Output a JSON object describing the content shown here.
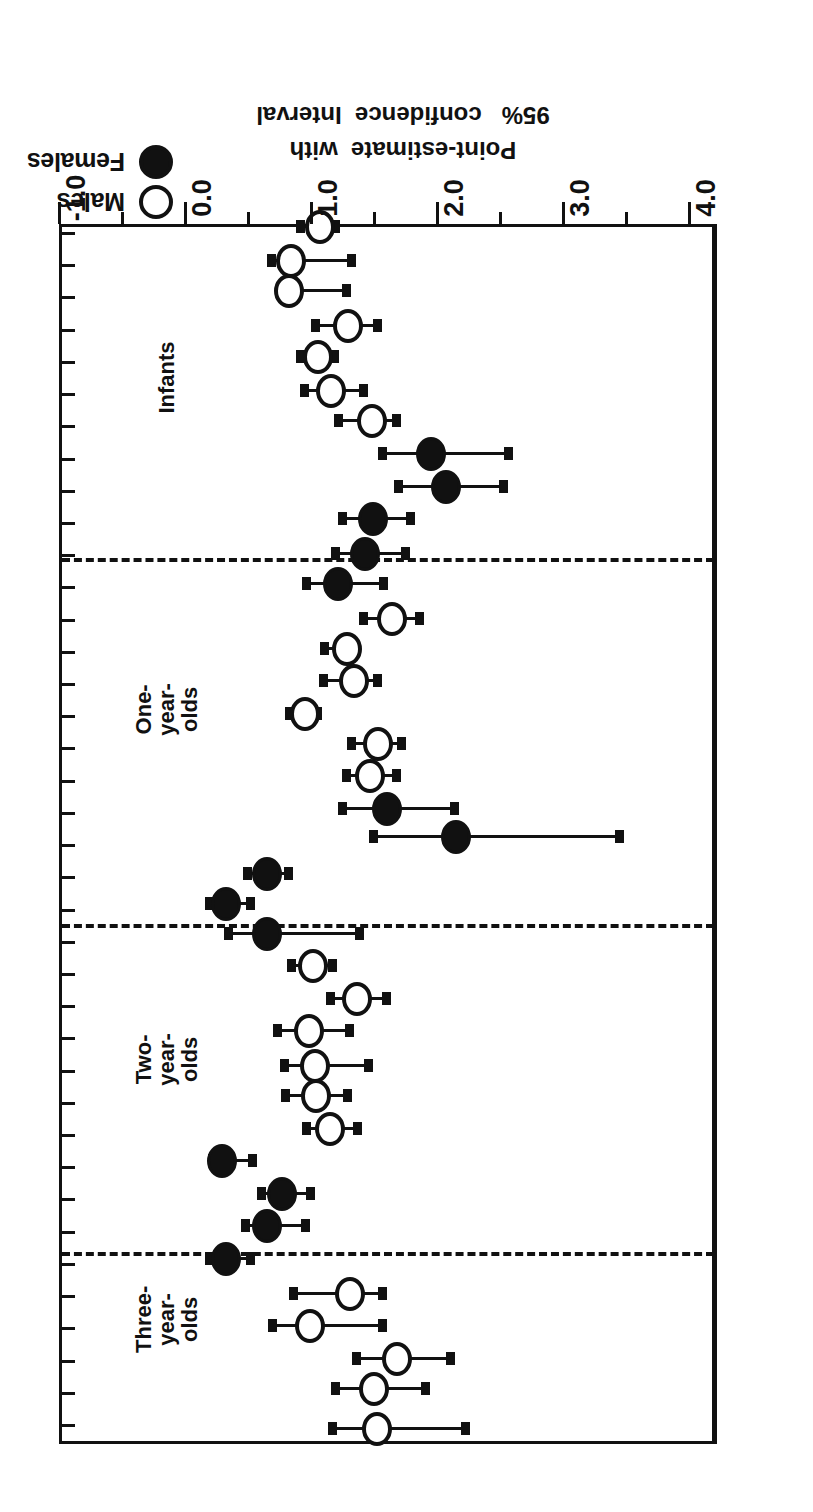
{
  "legend": {
    "items": [
      {
        "label": "Males",
        "marker": "open-circle-icon"
      },
      {
        "label": "Females",
        "marker": "filled-circle-icon"
      }
    ]
  },
  "axis": {
    "title_line1": "Point-estimate  with",
    "title_line2": "95%   confidence  Interval",
    "ticks": [
      "4.0",
      "3.0",
      "2.0",
      "1.0",
      "0.0",
      "-1.0"
    ]
  },
  "chart_data": {
    "type": "scatter",
    "title": "",
    "xlabel": "Point-estimate with 95% confidence Interval",
    "ylabel": "",
    "xlim": [
      -1.0,
      4.0
    ],
    "grid": false,
    "reference_line": 1.0,
    "legend_position": "top-left",
    "orientation": "forest-plot-horizontal-intervals",
    "group_labels": [
      "Infants",
      "One-year-olds",
      "Two-year-olds",
      "Three-\nyear-\nolds"
    ],
    "series": [
      {
        "name": "Males",
        "marker": "open-circle"
      },
      {
        "name": "Females",
        "marker": "filled-circle"
      }
    ],
    "groups": [
      {
        "name": "Infants",
        "points": [
          {
            "sex": "Males",
            "estimate": 0.61,
            "low": 0.21,
            "high": 0.95
          },
          {
            "sex": "Males",
            "estimate": 0.72,
            "low": 0.5,
            "high": 0.88
          },
          {
            "sex": "Males",
            "estimate": 0.79,
            "low": 0.56,
            "high": 1.01
          },
          {
            "sex": "Males",
            "estimate": 1.25,
            "low": 1.06,
            "high": 1.44
          },
          {
            "sex": "Males",
            "estimate": 0.99,
            "low": 0.78,
            "high": 1.13
          },
          {
            "sex": "Males",
            "estimate": 1.09,
            "low": 0.85,
            "high": 1.32
          },
          {
            "sex": "Males",
            "estimate": 1.44,
            "low": 1.17,
            "high": 1.64
          },
          {
            "sex": "Females",
            "estimate": 1.93,
            "low": 1.23,
            "high": 2.78
          },
          {
            "sex": "Females",
            "estimate": 1.62,
            "low": 1.1,
            "high": 2.6
          },
          {
            "sex": "Females",
            "estimate": 1.16,
            "low": 0.85,
            "high": 1.54
          },
          {
            "sex": "Females",
            "estimate": 1.0,
            "low": 0.77,
            "high": 1.54
          },
          {
            "sex": "Females",
            "estimate": 0.78,
            "low": 0.52,
            "high": 1.18
          }
        ]
      },
      {
        "name": "One-year-olds",
        "points": [
          {
            "sex": "Males",
            "estimate": 1.48,
            "low": 1.26,
            "high": 1.67
          },
          {
            "sex": "Males",
            "estimate": 1.11,
            "low": 0.91,
            "high": 1.3
          },
          {
            "sex": "Males",
            "estimate": 1.19,
            "low": 0.98,
            "high": 1.42
          },
          {
            "sex": "Males",
            "estimate": 0.63,
            "low": 0.44,
            "high": 0.79
          },
          {
            "sex": "Males",
            "estimate": 1.53,
            "low": 1.31,
            "high": 1.72
          },
          {
            "sex": "Males",
            "estimate": 1.47,
            "low": 1.22,
            "high": 1.69
          },
          {
            "sex": "Females",
            "estimate": 1.53,
            "low": 1.02,
            "high": 2.12
          },
          {
            "sex": "Females",
            "estimate": 2.23,
            "low": 1.26,
            "high": 3.44
          },
          {
            "sex": "Females",
            "estimate": 0.7,
            "low": 0.48,
            "high": 0.86
          },
          {
            "sex": "Females",
            "estimate": 0.34,
            "low": 0.16,
            "high": 0.46
          },
          {
            "sex": "Females",
            "estimate": 0.7,
            "low": 0.21,
            "high": 1.45
          }
        ]
      },
      {
        "name": "Two-year-olds",
        "points": [
          {
            "sex": "Males",
            "estimate": 1.0,
            "low": 0.76,
            "high": 1.17
          },
          {
            "sex": "Males",
            "estimate": 1.36,
            "low": 1.0,
            "high": 1.65
          },
          {
            "sex": "Males",
            "estimate": 1.09,
            "low": 0.74,
            "high": 1.41
          },
          {
            "sex": "Males",
            "estimate": 1.05,
            "low": 0.65,
            "high": 1.36
          },
          {
            "sex": "Males",
            "estimate": 1.11,
            "low": 0.79,
            "high": 1.5
          },
          {
            "sex": "Males",
            "estimate": 1.17,
            "low": 0.87,
            "high": 1.46
          },
          {
            "sex": "Females",
            "estimate": 0.18,
            "low": 0.02,
            "high": 0.34
          },
          {
            "sex": "Females",
            "estimate": 0.65,
            "low": 0.45,
            "high": 0.92
          },
          {
            "sex": "Females",
            "estimate": 0.77,
            "low": 0.55,
            "high": 0.94
          },
          {
            "sex": "Females",
            "estimate": 0.15,
            "low": 0.02,
            "high": 0.33
          }
        ]
      },
      {
        "name": "Three-year-olds",
        "points": [
          {
            "sex": "Males",
            "estimate": 1.08,
            "low": 0.78,
            "high": 1.29
          },
          {
            "sex": "Males",
            "estimate": 0.77,
            "low": 0.48,
            "high": 1.29
          },
          {
            "sex": "Males",
            "estimate": 1.64,
            "low": 1.13,
            "high": 1.93
          },
          {
            "sex": "Males",
            "estimate": 1.49,
            "low": 1.01,
            "high": 1.91
          },
          {
            "sex": "Males",
            "estimate": 1.52,
            "low": 0.87,
            "high": 2.11
          }
        ]
      }
    ]
  },
  "layout": {
    "rows": [
      {
        "y": 1282,
        "sex": "Males",
        "est": 1.08,
        "lo": 0.93,
        "hi": 1.21
      },
      {
        "y": 1248,
        "sex": "Males",
        "est": 0.85,
        "lo": 0.7,
        "hi": 1.33
      },
      {
        "y": 1218,
        "sex": "Males",
        "est": 0.83,
        "lo": 0.82,
        "hi": 1.29
      },
      {
        "y": 1183,
        "sex": "Males",
        "est": 1.3,
        "lo": 1.05,
        "hi": 1.54
      },
      {
        "y": 1152,
        "sex": "Males",
        "est": 1.06,
        "lo": 0.93,
        "hi": 1.2
      },
      {
        "y": 1118,
        "sex": "Males",
        "est": 1.17,
        "lo": 0.96,
        "hi": 1.43
      },
      {
        "y": 1088,
        "sex": "Males",
        "est": 1.49,
        "lo": 1.23,
        "hi": 1.69
      },
      {
        "y": 1055,
        "sex": "Females",
        "est": 1.96,
        "lo": 1.58,
        "hi": 2.58
      },
      {
        "y": 1022,
        "sex": "Females",
        "est": 2.08,
        "lo": 1.71,
        "hi": 2.54
      },
      {
        "y": 990,
        "sex": "Females",
        "est": 1.5,
        "lo": 1.26,
        "hi": 1.8
      },
      {
        "y": 955,
        "sex": "Females",
        "est": 1.44,
        "lo": 1.21,
        "hi": 1.76
      },
      {
        "y": 925,
        "sex": "Females",
        "est": 1.22,
        "lo": 0.98,
        "hi": 1.59
      },
      {
        "y": 890,
        "sex": "Males",
        "est": 1.65,
        "lo": 1.43,
        "hi": 1.87
      },
      {
        "y": 860,
        "sex": "Males",
        "est": 1.29,
        "lo": 1.12,
        "hi": 1.35
      },
      {
        "y": 828,
        "sex": "Males",
        "est": 1.35,
        "lo": 1.11,
        "hi": 1.54
      },
      {
        "y": 795,
        "sex": "Males",
        "est": 0.96,
        "lo": 0.84,
        "hi": 1.06
      },
      {
        "y": 765,
        "sex": "Males",
        "est": 1.54,
        "lo": 1.33,
        "hi": 1.73
      },
      {
        "y": 733,
        "sex": "Males",
        "est": 1.48,
        "lo": 1.29,
        "hi": 1.69
      },
      {
        "y": 700,
        "sex": "Females",
        "est": 1.61,
        "lo": 1.26,
        "hi": 2.15
      },
      {
        "y": 672,
        "sex": "Females",
        "est": 2.16,
        "lo": 1.51,
        "hi": 3.46
      },
      {
        "y": 635,
        "sex": "Females",
        "est": 0.66,
        "lo": 0.51,
        "hi": 0.83
      },
      {
        "y": 605,
        "sex": "Females",
        "est": 0.33,
        "lo": 0.21,
        "hi": 0.53
      },
      {
        "y": 575,
        "sex": "Females",
        "est": 0.66,
        "lo": 0.36,
        "hi": 1.4
      },
      {
        "y": 543,
        "sex": "Males",
        "est": 1.02,
        "lo": 0.86,
        "hi": 1.18
      },
      {
        "y": 510,
        "sex": "Males",
        "est": 1.37,
        "lo": 1.17,
        "hi": 1.61
      },
      {
        "y": 478,
        "sex": "Males",
        "est": 0.99,
        "lo": 0.75,
        "hi": 1.32
      },
      {
        "y": 443,
        "sex": "Males",
        "est": 1.04,
        "lo": 0.8,
        "hi": 1.47
      },
      {
        "y": 413,
        "sex": "Males",
        "est": 1.05,
        "lo": 0.81,
        "hi": 1.3
      },
      {
        "y": 380,
        "sex": "Males",
        "est": 1.16,
        "lo": 0.98,
        "hi": 1.38
      },
      {
        "y": 348,
        "sex": "Females",
        "est": 0.3,
        "lo": 0.23,
        "hi": 0.55
      },
      {
        "y": 315,
        "sex": "Females",
        "est": 0.78,
        "lo": 0.62,
        "hi": 1.01
      },
      {
        "y": 283,
        "sex": "Females",
        "est": 0.66,
        "lo": 0.49,
        "hi": 0.97
      },
      {
        "y": 250,
        "sex": "Females",
        "est": 0.33,
        "lo": 0.21,
        "hi": 0.53
      },
      {
        "y": 215,
        "sex": "Males",
        "est": 1.32,
        "lo": 0.87,
        "hi": 1.58
      },
      {
        "y": 183,
        "sex": "Males",
        "est": 1.0,
        "lo": 0.71,
        "hi": 1.58
      },
      {
        "y": 150,
        "sex": "Males",
        "est": 1.69,
        "lo": 1.37,
        "hi": 2.12
      },
      {
        "y": 120,
        "sex": "Males",
        "est": 1.51,
        "lo": 1.21,
        "hi": 1.92
      },
      {
        "y": 80,
        "sex": "Males",
        "est": 1.53,
        "lo": 1.18,
        "hi": 2.24
      }
    ],
    "separators": [
      253,
      581,
      947
    ],
    "group_labels": [
      {
        "text": "Infants",
        "y": 1120,
        "x": 643
      },
      {
        "text": "One-year-olds",
        "y": 765,
        "x": 643
      },
      {
        "text": "Two-year-olds",
        "y": 415,
        "x": 643
      },
      {
        "text": "Three-\nyear-\nolds",
        "y": 155,
        "x": 643
      }
    ],
    "x_ticks": [
      {
        "value": 4.0,
        "label": "4.0",
        "major": true
      },
      {
        "value": 3.5,
        "label": "",
        "major": false
      },
      {
        "value": 3.0,
        "label": "3.0",
        "major": true
      },
      {
        "value": 2.5,
        "label": "",
        "major": false
      },
      {
        "value": 2.0,
        "label": "2.0",
        "major": true
      },
      {
        "value": 1.5,
        "label": "",
        "major": false
      },
      {
        "value": 1.0,
        "label": "1.0",
        "major": true
      },
      {
        "value": 0.5,
        "label": "",
        "major": false
      },
      {
        "value": 0.0,
        "label": "0.0",
        "major": true
      },
      {
        "value": -0.5,
        "label": "",
        "major": false
      },
      {
        "value": -1.0,
        "label": "-1.0",
        "major": true
      }
    ],
    "side_ticks_count": 38
  }
}
